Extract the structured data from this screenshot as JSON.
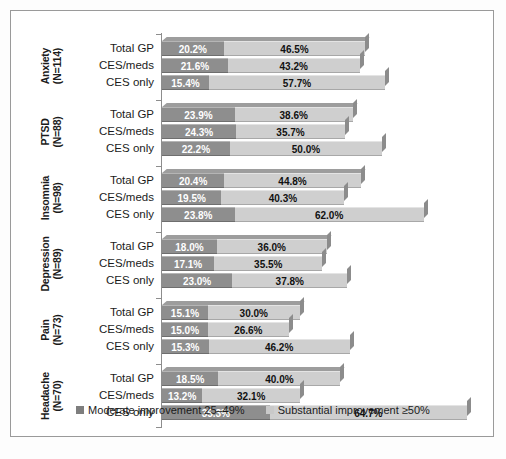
{
  "chart_data": {
    "type": "bar",
    "subtype": "stacked-horizontal-3d",
    "title": "",
    "xlabel": "",
    "ylabel": "",
    "xlim": [
      0,
      100
    ],
    "grid": false,
    "legend_position": "bottom-center",
    "series": [
      {
        "name": "Moderate improvement 25–49%",
        "color": "#8e8e8e"
      },
      {
        "name": "Substantial improvement ≥50%",
        "color": "#cfcfcf"
      }
    ],
    "groups": [
      {
        "condition": "Anxiety",
        "n_label": "(N=114)",
        "rows": [
          {
            "label": "Total GP",
            "moderate": 20.2,
            "substantial": 46.5,
            "moderate_text": "20.2%",
            "substantial_text": "46.5%"
          },
          {
            "label": "CES/meds",
            "moderate": 21.6,
            "substantial": 43.2,
            "moderate_text": "21.6%",
            "substantial_text": "43.2%"
          },
          {
            "label": "CES only",
            "moderate": 15.4,
            "substantial": 57.7,
            "moderate_text": "15.4%",
            "substantial_text": "57.7%"
          }
        ]
      },
      {
        "condition": "PTSD",
        "n_label": "(N=88)",
        "rows": [
          {
            "label": "Total GP",
            "moderate": 23.9,
            "substantial": 38.6,
            "moderate_text": "23.9%",
            "substantial_text": "38.6%"
          },
          {
            "label": "CES/meds",
            "moderate": 24.3,
            "substantial": 35.7,
            "moderate_text": "24.3%",
            "substantial_text": "35.7%"
          },
          {
            "label": "CES only",
            "moderate": 22.2,
            "substantial": 50.0,
            "moderate_text": "22.2%",
            "substantial_text": "50.0%"
          }
        ]
      },
      {
        "condition": "Insomnia",
        "n_label": "(N=98)",
        "rows": [
          {
            "label": "Total GP",
            "moderate": 20.4,
            "substantial": 44.8,
            "moderate_text": "20.4%",
            "substantial_text": "44.8%"
          },
          {
            "label": "CES/meds",
            "moderate": 19.5,
            "substantial": 40.3,
            "moderate_text": "19.5%",
            "substantial_text": "40.3%"
          },
          {
            "label": "CES only",
            "moderate": 23.8,
            "substantial": 62.0,
            "moderate_text": "23.8%",
            "substantial_text": "62.0%"
          }
        ]
      },
      {
        "condition": "Depression",
        "n_label": "(N=89)",
        "rows": [
          {
            "label": "Total GP",
            "moderate": 18.0,
            "substantial": 36.0,
            "moderate_text": "18.0%",
            "substantial_text": "36.0%"
          },
          {
            "label": "CES/meds",
            "moderate": 17.1,
            "substantial": 35.5,
            "moderate_text": "17.1%",
            "substantial_text": "35.5%"
          },
          {
            "label": "CES only",
            "moderate": 23.0,
            "substantial": 37.8,
            "moderate_text": "23.0%",
            "substantial_text": "37.8%"
          }
        ]
      },
      {
        "condition": "Pain",
        "n_label": "(N=73)",
        "rows": [
          {
            "label": "Total GP",
            "moderate": 15.1,
            "substantial": 30.0,
            "moderate_text": "15.1%",
            "substantial_text": "30.0%"
          },
          {
            "label": "CES/meds",
            "moderate": 15.0,
            "substantial": 26.6,
            "moderate_text": "15.0%",
            "substantial_text": "26.6%"
          },
          {
            "label": "CES only",
            "moderate": 15.3,
            "substantial": 46.2,
            "moderate_text": "15.3%",
            "substantial_text": "46.2%"
          }
        ]
      },
      {
        "condition": "Headache",
        "n_label": "(N=70)",
        "rows": [
          {
            "label": "Total GP",
            "moderate": 18.5,
            "substantial": 40.0,
            "moderate_text": "18.5%",
            "substantial_text": "40.0%"
          },
          {
            "label": "CES/meds",
            "moderate": 13.2,
            "substantial": 32.1,
            "moderate_text": "13.2%",
            "substantial_text": "32.1%"
          },
          {
            "label": "CES only",
            "moderate": 35.3,
            "substantial": 64.7,
            "moderate_text": "35.3%",
            "substantial_text": "64.7%"
          }
        ]
      }
    ]
  },
  "legend": {
    "items": [
      {
        "label": "Moderate improvement 25–49%",
        "swatch": "moderate"
      },
      {
        "label": "Substantial improvement ≥50%",
        "swatch": "substantial"
      }
    ]
  },
  "colors": {
    "moderate": "#8e8e8e",
    "substantial": "#cfcfcf",
    "frame": "#9a9a9a",
    "axis": "#8d8d8d",
    "background": "#ffffff"
  }
}
